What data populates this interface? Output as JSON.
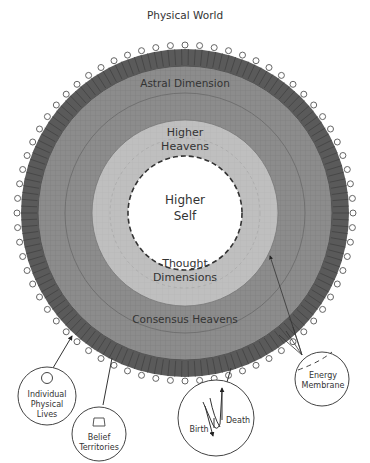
{
  "diagram": {
    "title": "Physical World",
    "center": {
      "x": 185,
      "y": 213
    },
    "colors": {
      "membrane_dark": "#5a5a5a",
      "astral": "#8a8a8a",
      "consensus": "#7f7f7f",
      "thought": "#bdbdbd",
      "higher_self": "#ffffff",
      "bead_stroke": "#555555",
      "text": "#333333"
    },
    "rings": [
      {
        "name": "Astral Dimension",
        "label": "Astral Dimension"
      },
      {
        "name": "Higher Heavens",
        "line1": "Higher",
        "line2": "Heavens"
      },
      {
        "name": "Higher Self",
        "line1": "Higher",
        "line2": "Self"
      },
      {
        "name": "Thought Dimensions",
        "line1": "Thought",
        "line2": "Dimensions"
      },
      {
        "name": "Consensus Heavens",
        "label": "Consensus Heavens"
      }
    ],
    "callouts": {
      "individual": {
        "line1": "Individual",
        "line2": "Physical",
        "line3": "Lives"
      },
      "belief": {
        "line1": "Belief",
        "line2": "Territories"
      },
      "birth_death": {
        "birth": "Birth",
        "death": "Death"
      },
      "energy": {
        "line1": "Energy",
        "line2": "Membrane"
      }
    }
  }
}
